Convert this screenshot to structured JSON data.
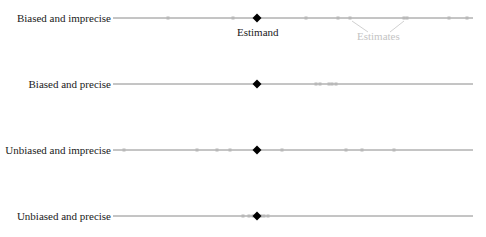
{
  "diagram": {
    "axis": {
      "x_start": 113,
      "x_end": 473,
      "estimand_x": 257
    },
    "colors": {
      "line": "#8a8a8a",
      "estimate": "#b8b8b8",
      "estimand": "#000000",
      "label": "#1a1a1a",
      "annotation_estimates": "#c4c4c4"
    },
    "rows": [
      {
        "label": "Biased and imprecise",
        "y": 18,
        "estimates": [
          168,
          233,
          306,
          338,
          350,
          404,
          407,
          449,
          467
        ]
      },
      {
        "label": "Biased and precise",
        "y": 84,
        "estimates": [
          316,
          320,
          329,
          332,
          336
        ]
      },
      {
        "label": "Unbiased and imprecise",
        "y": 150,
        "estimates": [
          124,
          197,
          217,
          230,
          282,
          346,
          362,
          394
        ]
      },
      {
        "label": "Unbiased and precise",
        "y": 216,
        "estimates": [
          243,
          249,
          253,
          261,
          264,
          268
        ]
      }
    ],
    "annotations": {
      "estimand_label": "Estimand",
      "estimates_label": "Estimates"
    }
  }
}
